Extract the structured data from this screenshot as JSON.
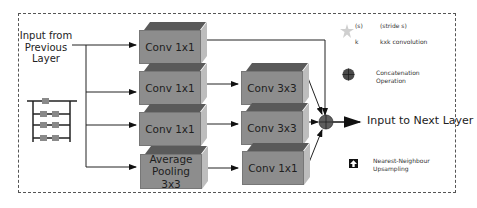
{
  "diagram": {
    "input_label": "Input from Previous Layer",
    "input_lines": [
      "Input from",
      "Previous",
      "Layer"
    ],
    "output_label": "Input to Next Layer",
    "branches": [
      {
        "blocks": [
          "Conv 1x1"
        ]
      },
      {
        "blocks": [
          "Conv 1x1",
          "Conv 3x3"
        ]
      },
      {
        "blocks": [
          "Conv 1x1",
          "Conv 3x3"
        ]
      },
      {
        "blocks": [
          "Average Pooling 3x3",
          "Conv 1x1"
        ]
      }
    ],
    "blocks": {
      "b1_conv1": "Conv 1x1",
      "b2_conv1": "Conv 1x1",
      "b3_conv1": "Conv 1x1",
      "b4_pool_l1": "Average",
      "b4_pool_l2": "Pooling",
      "b4_pool_l3": "3x3",
      "b2_conv3": "Conv 3x3",
      "b3_conv3": "Conv 3x3",
      "b4_conv1": "Conv 1x1"
    },
    "colors": {
      "block_front": "#8d8d8d",
      "block_top": "#5a5a5a",
      "block_side": "#bdbdbd",
      "concat_node": "#5e5e5e",
      "frame": "#555555"
    }
  },
  "legend": {
    "conv_s": "(s)",
    "conv_k": "k",
    "stride_label": "(stride s)",
    "conv_label": "kxk convolution",
    "concat_line1": "Concatenation",
    "concat_line2": "Operation",
    "upsample_line1": "Nearest-Neighbour",
    "upsample_line2": "Upsampling"
  }
}
